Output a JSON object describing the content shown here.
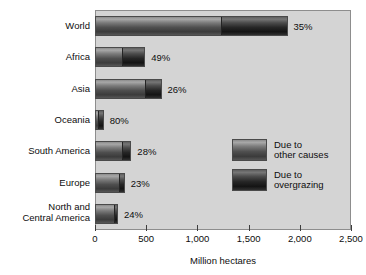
{
  "chart_data": {
    "type": "bar",
    "orientation": "horizontal",
    "stacked": true,
    "title": "",
    "xlabel": "Million hectares",
    "ylabel": "",
    "xlim": [
      0,
      2500
    ],
    "xticks": [
      0,
      500,
      1000,
      1500,
      2000,
      2500
    ],
    "xtick_labels": [
      "0",
      "500",
      "1,000",
      "1,500",
      "2,000",
      "2,500"
    ],
    "grid": false,
    "legend_position": "inside-right",
    "categories": [
      "World",
      "Africa",
      "Asia",
      "Oceania",
      "South America",
      "Europe",
      "North and\nCentral America"
    ],
    "series": [
      {
        "name": "Due to\nother causes",
        "key": "other",
        "color": "#6e6e6e",
        "values": [
          1220,
          250,
          480,
          17,
          255,
          223,
          171
        ]
      },
      {
        "name": "Due to\novergrazing",
        "key": "overgrazing",
        "color": "#242424",
        "values": [
          660,
          240,
          170,
          68,
          100,
          67,
          54
        ]
      }
    ],
    "totals": [
      1880,
      490,
      650,
      85,
      355,
      290,
      225
    ],
    "annotations": [
      "35%",
      "49%",
      "26%",
      "80%",
      "28%",
      "23%",
      "24%"
    ],
    "annotation_meaning": "share of degraded area due to overgrazing"
  },
  "legend": {
    "items": [
      {
        "label": "Due to\nother causes"
      },
      {
        "label": "Due to\novergrazing"
      }
    ]
  },
  "axis": {
    "x_title": "Million hectares"
  }
}
